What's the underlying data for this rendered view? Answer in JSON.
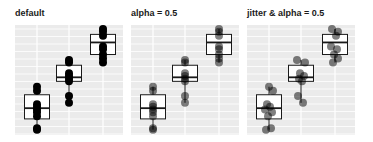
{
  "chart_data": [
    {
      "type": "box",
      "title": "default",
      "categories": [
        "A",
        "B",
        "C"
      ],
      "boxes": [
        {
          "q1": 2.2,
          "median": 3.0,
          "q3": 4.0,
          "min": 1.4,
          "max": 4.6,
          "points": [
            1.4,
            1.5,
            2.4,
            2.7,
            2.9,
            3.1,
            3.3,
            4.3,
            4.6
          ]
        },
        {
          "q1": 5.0,
          "median": 5.3,
          "q3": 6.2,
          "min": 3.4,
          "max": 6.6,
          "points": [
            3.4,
            3.9,
            5.0,
            5.2,
            5.4,
            5.6,
            6.4,
            6.6
          ]
        },
        {
          "q1": 7.0,
          "median": 7.9,
          "q3": 8.5,
          "min": 6.4,
          "max": 8.9,
          "points": [
            6.4,
            6.7,
            7.0,
            7.4,
            7.6,
            8.4,
            8.7,
            8.9
          ]
        }
      ],
      "point_alpha": 1.0,
      "jitter": false,
      "grid": true,
      "xlabel": "",
      "ylabel": ""
    },
    {
      "type": "box",
      "title": "alpha = 0.5",
      "categories": [
        "A",
        "B",
        "C"
      ],
      "boxes": [
        {
          "q1": 2.2,
          "median": 3.0,
          "q3": 4.0,
          "min": 1.4,
          "max": 4.6,
          "points": [
            1.4,
            1.5,
            2.4,
            2.7,
            2.9,
            3.1,
            3.3,
            4.3,
            4.6
          ]
        },
        {
          "q1": 5.0,
          "median": 5.3,
          "q3": 6.2,
          "min": 3.4,
          "max": 6.6,
          "points": [
            3.4,
            3.9,
            5.0,
            5.2,
            5.4,
            5.6,
            6.4,
            6.6
          ]
        },
        {
          "q1": 7.0,
          "median": 7.9,
          "q3": 8.5,
          "min": 6.4,
          "max": 8.9,
          "points": [
            6.4,
            6.7,
            7.0,
            7.4,
            7.6,
            8.4,
            8.7,
            8.9
          ]
        }
      ],
      "point_alpha": 0.5,
      "jitter": false,
      "grid": true,
      "xlabel": "",
      "ylabel": ""
    },
    {
      "type": "box",
      "title": "jitter & alpha = 0.5",
      "categories": [
        "A",
        "B",
        "C"
      ],
      "boxes": [
        {
          "q1": 2.2,
          "median": 3.0,
          "q3": 4.0,
          "min": 1.4,
          "max": 4.6,
          "points": [
            1.4,
            1.5,
            2.4,
            2.7,
            2.9,
            3.1,
            3.3,
            4.3,
            4.6
          ]
        },
        {
          "q1": 5.0,
          "median": 5.3,
          "q3": 6.2,
          "min": 3.4,
          "max": 6.6,
          "points": [
            3.4,
            3.9,
            5.0,
            5.2,
            5.4,
            5.6,
            6.4,
            6.6
          ]
        },
        {
          "q1": 7.0,
          "median": 7.9,
          "q3": 8.5,
          "min": 6.4,
          "max": 8.9,
          "points": [
            6.4,
            6.7,
            7.0,
            7.4,
            7.6,
            8.4,
            8.7,
            8.9
          ]
        }
      ],
      "point_alpha": 0.5,
      "jitter": true,
      "grid": true,
      "xlabel": "",
      "ylabel": ""
    }
  ],
  "panels": [
    {
      "title": "default"
    },
    {
      "title": "alpha = 0.5"
    },
    {
      "title": "jitter & alpha = 0.5"
    }
  ],
  "colors": {
    "panel_bg": "#ebebeb",
    "grid": "#ffffff",
    "box_fill": "#ffffff",
    "box_stroke": "#1a1a1a",
    "point": "#000000"
  }
}
